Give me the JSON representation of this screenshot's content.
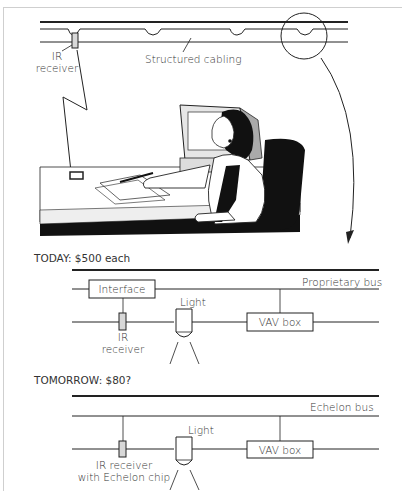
{
  "top_illustration": {
    "labels": {
      "ir_receiver_line1": "IR",
      "ir_receiver_line2": "receiver",
      "structured_cabling": "Structured cabling"
    },
    "figure": "office-worker-at-desk"
  },
  "today": {
    "heading": "TODAY: $500 each",
    "bus_label": "Proprietary bus",
    "interface_label": "Interface",
    "light_label": "Light",
    "vav_label": "VAV box",
    "ir_line1": "IR",
    "ir_line2": "receiver"
  },
  "tomorrow": {
    "heading": "TOMORROW: $80?",
    "bus_label": "Echelon bus",
    "light_label": "Light",
    "vav_label": "VAV box",
    "ir_line1": "IR receiver",
    "ir_line2": "with Echelon chip"
  },
  "colors": {
    "line": "#222222",
    "receiver_fill": "#d8d8d8",
    "text": "#333333"
  }
}
